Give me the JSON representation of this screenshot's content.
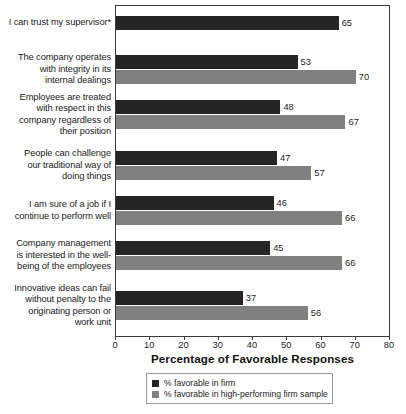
{
  "chart_data": {
    "type": "bar",
    "orientation": "horizontal",
    "title": "",
    "xlabel": "Percentage of Favorable Responses",
    "ylabel": "",
    "xlim": [
      0,
      80
    ],
    "xticks": [
      0,
      10,
      20,
      30,
      40,
      50,
      60,
      70,
      80
    ],
    "grid": false,
    "legend_position": "bottom-center",
    "categories": [
      "I can trust my supervisor*",
      "The company operates with integrity in its internal dealings",
      "Employees are treated with respect in this company regardless of their position",
      "People can challenge our traditional way of doing things",
      "I am sure of a job if I continue to perform well",
      "Company management is interested in the well-being of the employees",
      "Innovative ideas can fail without penalty to the originating person or work unit"
    ],
    "category_lines": [
      [
        "I can trust my supervisor*"
      ],
      [
        "The company operates",
        "with integrity in its",
        "internal dealings"
      ],
      [
        "Employees are treated",
        "with respect in this",
        "company regardless of",
        "their position"
      ],
      [
        "People can challenge",
        "our traditional way of",
        "doing things"
      ],
      [
        "I am sure of a job if I",
        "continue to perform well"
      ],
      [
        "Company management",
        "is interested in the well-",
        "being of the employees"
      ],
      [
        "Innovative ideas can fail",
        "without penalty to the",
        "originating person or",
        "work unit"
      ]
    ],
    "series": [
      {
        "name": "% favorable in firm",
        "color": "#252525",
        "values": [
          65,
          53,
          48,
          47,
          46,
          45,
          37
        ]
      },
      {
        "name": "% favorable in high-performing firm sample",
        "color": "#808080",
        "values": [
          null,
          70,
          67,
          57,
          66,
          66,
          56
        ]
      }
    ]
  },
  "legend": {
    "items": [
      {
        "label": "% favorable in firm",
        "color": "#252525"
      },
      {
        "label": "% favorable in high-performing firm sample",
        "color": "#808080"
      }
    ]
  },
  "footnote": ""
}
